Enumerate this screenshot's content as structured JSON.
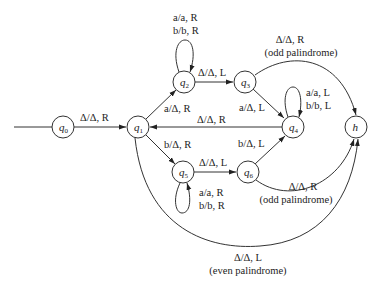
{
  "diagram": {
    "type": "turing-machine-state-diagram",
    "states": [
      {
        "id": "q0",
        "name": "q",
        "sub": "0",
        "x": 63,
        "y": 127
      },
      {
        "id": "q1",
        "name": "q",
        "sub": "1",
        "x": 138,
        "y": 127
      },
      {
        "id": "q2",
        "name": "q",
        "sub": "2",
        "x": 184,
        "y": 82
      },
      {
        "id": "q3",
        "name": "q",
        "sub": "3",
        "x": 245,
        "y": 81
      },
      {
        "id": "q4",
        "name": "q",
        "sub": "4",
        "x": 293,
        "y": 127
      },
      {
        "id": "q5",
        "name": "q",
        "sub": "5",
        "x": 183,
        "y": 172
      },
      {
        "id": "q6",
        "name": "q",
        "sub": "6",
        "x": 248,
        "y": 172
      },
      {
        "id": "h",
        "name": "h",
        "sub": "",
        "x": 356,
        "y": 127
      }
    ],
    "start_state": "q0",
    "transitions": [
      {
        "from": "q0",
        "to": "q1",
        "label": "Δ/Δ, R"
      },
      {
        "from": "q1",
        "to": "q2",
        "label": "a/Δ, R"
      },
      {
        "from": "q2",
        "to": "q2",
        "label_lines": [
          "a/a, R",
          "b/b, R"
        ]
      },
      {
        "from": "q2",
        "to": "q3",
        "label": "Δ/Δ, L"
      },
      {
        "from": "q3",
        "to": "q4",
        "label": "a/Δ, L"
      },
      {
        "from": "q3",
        "to": "h",
        "label_lines": [
          "Δ/Δ, R",
          "(odd palindrome)"
        ]
      },
      {
        "from": "q4",
        "to": "q4",
        "label_lines": [
          "a/a, L",
          "b/b, L"
        ]
      },
      {
        "from": "q4",
        "to": "q1",
        "label": "Δ/Δ, R"
      },
      {
        "from": "q1",
        "to": "q5",
        "label": "b/Δ, R"
      },
      {
        "from": "q5",
        "to": "q5",
        "label_lines": [
          "a/a, R",
          "b/b, R"
        ]
      },
      {
        "from": "q5",
        "to": "q6",
        "label": "Δ/Δ, L"
      },
      {
        "from": "q6",
        "to": "q4",
        "label": "b/Δ, L"
      },
      {
        "from": "q6",
        "to": "h",
        "label_lines": [
          "Δ/Δ, R",
          "(odd palindrome)"
        ]
      },
      {
        "from": "q1",
        "to": "h",
        "label_lines": [
          "Δ/Δ, L",
          "(even palindrome)"
        ]
      }
    ]
  },
  "labels": {
    "q0_q1": "Δ/Δ, R",
    "q1_q2": "a/Δ, R",
    "q2_loop_1": "a/a, R",
    "q2_loop_2": "b/b, R",
    "q2_q3": "Δ/Δ, L",
    "q3_q4": "a/Δ, L",
    "q3_h_1": "Δ/Δ, R",
    "q3_h_2": "(odd palindrome)",
    "q4_loop_1": "a/a, L",
    "q4_loop_2": "b/b, L",
    "q4_q1": "Δ/Δ, R",
    "q1_q5": "b/Δ, R",
    "q5_loop_1": "a/a, R",
    "q5_loop_2": "b/b, R",
    "q5_q6": "Δ/Δ, L",
    "q6_q4": "b/Δ, L",
    "q6_h_1": "Δ/Δ, R",
    "q6_h_2": "(odd palindrome)",
    "q1_h_1": "Δ/Δ, L",
    "q1_h_2": "(even palindrome)"
  },
  "nodes": {
    "q0": {
      "name": "q",
      "sub": "0"
    },
    "q1": {
      "name": "q",
      "sub": "1"
    },
    "q2": {
      "name": "q",
      "sub": "2"
    },
    "q3": {
      "name": "q",
      "sub": "3"
    },
    "q4": {
      "name": "q",
      "sub": "4"
    },
    "q5": {
      "name": "q",
      "sub": "5"
    },
    "q6": {
      "name": "q",
      "sub": "6"
    },
    "h": {
      "name": "h"
    }
  },
  "colors": {
    "line": "#333333",
    "text": "#222222",
    "background": "#ffffff"
  }
}
